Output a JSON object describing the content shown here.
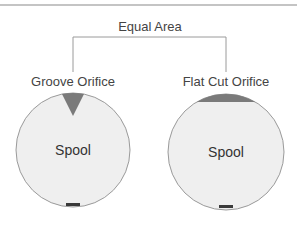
{
  "title": "Equal Area",
  "colors": {
    "line": "#888888",
    "circle_fill": "#efefef",
    "circle_stroke": "#9a9a9a",
    "orifice_fill": "#7a7a7a",
    "text": "#444444",
    "logo": "#3a3a3a"
  },
  "left": {
    "label": "Groove Orifice",
    "body_label": "Spool",
    "orifice_shape": "triangle-groove"
  },
  "right": {
    "label": "Flat Cut Orifice",
    "body_label": "Spool",
    "orifice_shape": "flat-cut-segment"
  }
}
